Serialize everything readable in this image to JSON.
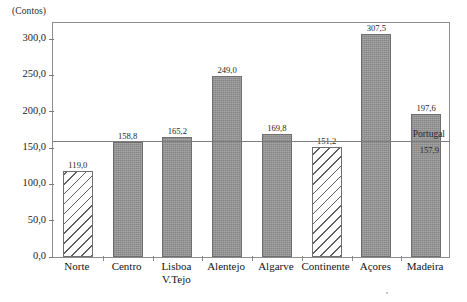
{
  "chart_data": {
    "type": "bar",
    "title": "",
    "subtitle": "",
    "xlabel": "",
    "ylabel": "(Contos)",
    "ylim": [
      0,
      325
    ],
    "yticks": [
      "0,0",
      "50,0",
      "100,0",
      "150,0",
      "200,0",
      "250,0",
      "300,0"
    ],
    "ytick_values": [
      0,
      50,
      100,
      150,
      200,
      250,
      300
    ],
    "grid": false,
    "legend": "none",
    "categories": [
      "Norte",
      "Centro",
      "Lisboa V.Tejo",
      "Alentejo",
      "Algarve",
      "Continente",
      "Açores",
      "Madeira"
    ],
    "values": [
      119.0,
      158.8,
      165.2,
      249.0,
      169.8,
      151.2,
      307.5,
      197.6
    ],
    "value_labels": [
      "119,0",
      "158,8",
      "165,2",
      "249,0",
      "169,8",
      "151,2",
      "307,5",
      "197,6"
    ],
    "bar_styles": [
      "hatched",
      "solid",
      "solid",
      "solid",
      "solid",
      "hatched",
      "solid",
      "solid"
    ],
    "bar_color": "#939393",
    "bar_edge_color": "#6f6f6f",
    "reference_line": {
      "name": "Portugal",
      "value": 157.9,
      "value_label": "157,9",
      "color": "#7d7d7d"
    }
  },
  "axis": {
    "y_unit_caption": "(Contos)"
  },
  "bars": [
    {
      "label": "Norte",
      "label_line1": "Norte",
      "label_line2": "",
      "value_label": "119,0",
      "value": 119.0,
      "style": "hatched"
    },
    {
      "label": "Centro",
      "label_line1": "Centro",
      "label_line2": "",
      "value_label": "158,8",
      "value": 158.8,
      "style": "solid"
    },
    {
      "label": "Lisboa V.Tejo",
      "label_line1": "Lisboa",
      "label_line2": "V.Tejo",
      "value_label": "165,2",
      "value": 165.2,
      "style": "solid"
    },
    {
      "label": "Alentejo",
      "label_line1": "Alentejo",
      "label_line2": "",
      "value_label": "249,0",
      "value": 249.0,
      "style": "solid"
    },
    {
      "label": "Algarve",
      "label_line1": "Algarve",
      "label_line2": "",
      "value_label": "169,8",
      "value": 169.8,
      "style": "solid"
    },
    {
      "label": "Continente",
      "label_line1": "Continente",
      "label_line2": "",
      "value_label": "151,2",
      "value": 151.2,
      "style": "hatched"
    },
    {
      "label": "Açores",
      "label_line1": "Açores",
      "label_line2": "",
      "value_label": "307,5",
      "value": 307.5,
      "style": "solid"
    },
    {
      "label": "Madeira",
      "label_line1": "Madeira",
      "label_line2": "",
      "value_label": "197,6",
      "value": 197.6,
      "style": "solid"
    }
  ],
  "reference": {
    "name": "Portugal",
    "value_label": "157,9",
    "value": 157.9
  }
}
